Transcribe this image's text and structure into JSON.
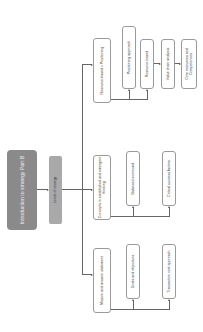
{
  "diagram": {
    "orientation": "rotated -90deg",
    "root": {
      "label": "Introduction to strategy Part B",
      "color": "#8a8a8a"
    },
    "level": {
      "label": "Levels of strategy",
      "color": "#a9a9a9"
    },
    "branches": [
      {
        "label": "Mission and mission statement",
        "children": [
          "Goals and objectives",
          "Transaction cost approach"
        ]
      },
      {
        "label": "Concepts in established and emergent thinking",
        "children": [
          "Balanced scorecard",
          "Critical success factors"
        ]
      },
      {
        "label": "Resource-based v Positioning",
        "children": [
          "Positioning approach",
          "Resource-based"
        ],
        "chain": [
          "Value chain analysis",
          "Core resources and Competences"
        ]
      }
    ]
  }
}
